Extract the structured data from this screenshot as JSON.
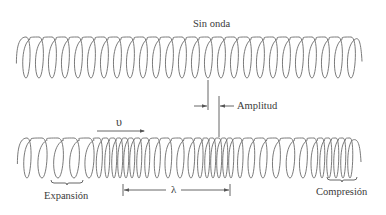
{
  "labels": {
    "top_title": "Sin onda",
    "amplitude": "Amplitud",
    "velocity_symbol": "υ",
    "wavelength_symbol": "λ",
    "expansion": "Expansión",
    "compression": "Compresión"
  },
  "style": {
    "stroke_color": "#6b6b6b",
    "line_color": "#555555"
  },
  "springs": [
    {
      "name": "spring-at-rest",
      "top_y": 37,
      "bottom_y": 78,
      "centers": [
        26,
        39,
        52,
        65,
        78,
        91,
        104,
        117,
        130,
        143,
        156,
        169,
        182,
        195,
        208,
        221,
        234,
        247,
        260,
        273,
        286,
        299,
        312,
        325,
        338,
        351
      ]
    },
    {
      "name": "spring-with-wave",
      "top_y": 138,
      "bottom_y": 178,
      "centers": [
        27,
        42,
        58,
        74,
        89,
        99,
        107,
        114,
        120,
        126,
        132,
        139,
        147,
        157,
        168,
        180,
        191,
        200,
        207,
        213,
        219,
        225,
        231,
        240,
        251,
        263,
        276,
        290,
        303,
        314,
        322,
        329,
        336,
        343,
        350
      ]
    }
  ],
  "amplitude_marker": {
    "line1": {
      "x": 208,
      "y1": 80,
      "y2": 110
    },
    "line2": {
      "x": 219,
      "y1": 96,
      "y2": 137
    },
    "arrow_y": 106
  },
  "velocity_arrow": {
    "x1": 97,
    "x2": 145,
    "y": 131
  },
  "wavelength": {
    "x1": 123,
    "x2": 230,
    "y": 190
  },
  "expansion_brace": {
    "x1": 51,
    "x2": 83,
    "y": 182
  },
  "compression_brace": {
    "x1": 327,
    "x2": 357,
    "y": 179
  }
}
